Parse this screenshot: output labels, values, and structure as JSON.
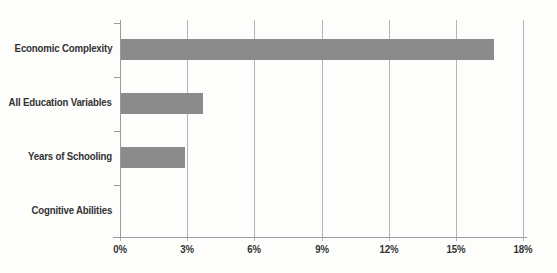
{
  "figure": {
    "title": "",
    "background_color": "#fdfdfb"
  },
  "chart_data": {
    "type": "bar",
    "orientation": "horizontal",
    "title": "",
    "xlabel": "",
    "ylabel": "",
    "categories": [
      "Economic Complexity",
      "All Education Variables",
      "Years of Schooling",
      "Cognitive Abilities"
    ],
    "values": [
      16.7,
      3.7,
      2.9,
      0
    ],
    "value_unit": "%",
    "xlim": [
      0,
      18
    ],
    "xticks": [
      {
        "value": 0,
        "label": "0%"
      },
      {
        "value": 3,
        "label": "3%"
      },
      {
        "value": 6,
        "label": "6%"
      },
      {
        "value": 9,
        "label": "9%"
      },
      {
        "value": 12,
        "label": "12%"
      },
      {
        "value": 15,
        "label": "15%"
      },
      {
        "value": 18,
        "label": "18%"
      }
    ],
    "grid": true,
    "legend": null,
    "colors": {
      "bar": "#8b8b8b",
      "gridline": "#b4b4b4",
      "axis": "#9b9b9b",
      "text": "#333333"
    }
  }
}
